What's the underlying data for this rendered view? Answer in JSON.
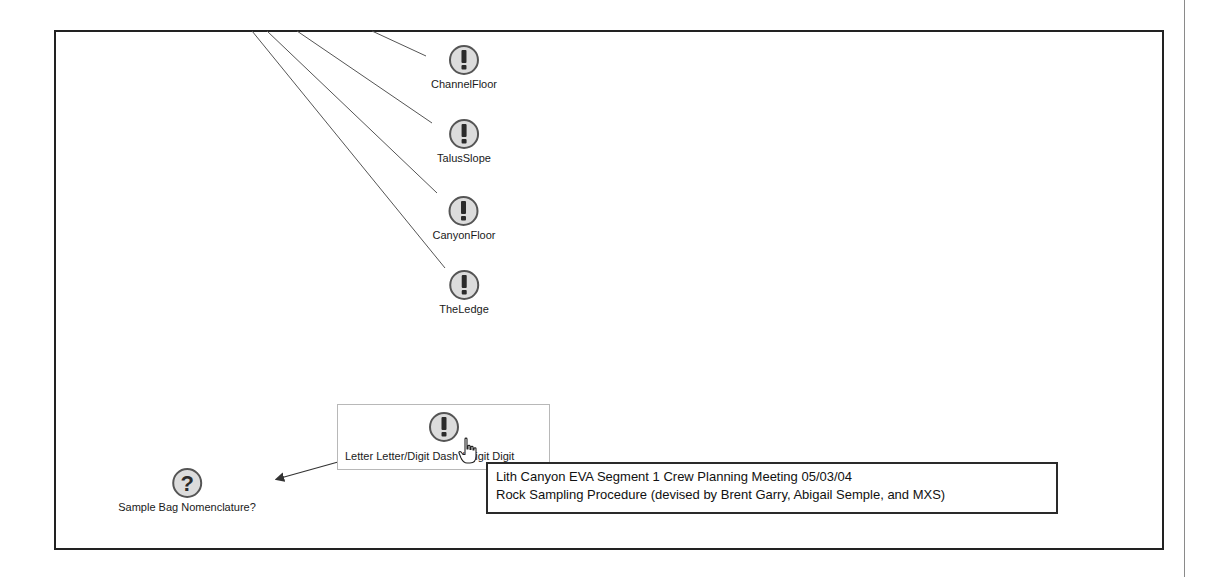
{
  "diagram": {
    "nodes": [
      {
        "id": "channel-floor",
        "label": "ChannelFloor",
        "icon": "exclamation-icon",
        "x": 464,
        "y": 44
      },
      {
        "id": "talus-slope",
        "label": "TalusSlope",
        "icon": "exclamation-icon",
        "x": 464,
        "y": 118
      },
      {
        "id": "canyon-floor",
        "label": "CanyonFloor",
        "icon": "exclamation-icon",
        "x": 464,
        "y": 195
      },
      {
        "id": "the-ledge",
        "label": "TheLedge",
        "icon": "exclamation-icon",
        "x": 464,
        "y": 269
      },
      {
        "id": "sample-bag-nomenclature",
        "label": "Sample Bag Nomenclature?",
        "icon": "question-icon",
        "x": 187,
        "y": 467
      }
    ],
    "selected_node": {
      "label": "Letter Letter/Digit Dash / Digit Digit",
      "icon": "exclamation-icon"
    },
    "links": [
      {
        "from": [
          372,
          31
        ],
        "to": [
          426,
          56
        ]
      },
      {
        "from": [
          297,
          31
        ],
        "to": [
          432,
          123
        ]
      },
      {
        "from": [
          267,
          31
        ],
        "to": [
          437,
          193
        ]
      },
      {
        "from": [
          252,
          31
        ],
        "to": [
          445,
          268
        ]
      }
    ],
    "arrow": {
      "from": [
        338,
        462
      ],
      "to": [
        277,
        479
      ]
    }
  },
  "tooltip": {
    "line1": "Lith Canyon EVA Segment 1 Crew Planning Meeting 05/03/04",
    "line2": "Rock Sampling Procedure (devised by Brent Garry, Abigail Semple, and MXS)"
  },
  "colors": {
    "frame": "#222222",
    "icon_fill": "#d9d9d9",
    "icon_stroke": "#555555",
    "glyph": "#2b2b2b",
    "line": "#555555"
  }
}
